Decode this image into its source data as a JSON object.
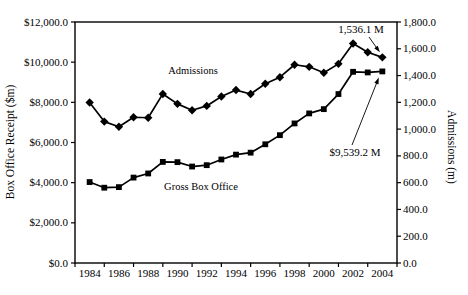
{
  "chart_data": {
    "type": "line",
    "title": "",
    "x": [
      1984,
      1985,
      1986,
      1987,
      1988,
      1989,
      1990,
      1991,
      1992,
      1993,
      1994,
      1995,
      1996,
      1997,
      1998,
      1999,
      2000,
      2001,
      2002,
      2003,
      2004
    ],
    "x_tick_labels": [
      "1984",
      "1986",
      "1988",
      "1990",
      "1992",
      "1994",
      "1996",
      "1998",
      "2000",
      "2002",
      "2004"
    ],
    "ylabel_left": "Box Office Receipt ($m)",
    "ylabel_right": "Admissions (m)",
    "ylim_left": [
      0,
      12000
    ],
    "ylim_right": [
      0,
      1800
    ],
    "y_left_tick_labels": [
      "$0.0",
      "$2,000.0",
      "$4,000.0",
      "$6,000.0",
      "$8,000.0",
      "$10,000.0",
      "$12,000.0"
    ],
    "y_right_tick_labels": [
      "0.0",
      "200.0",
      "400.0",
      "600.0",
      "800.0",
      "1,000.0",
      "1,200.0",
      "1,400.0",
      "1,600.0",
      "1,800.0"
    ],
    "grid": false,
    "legend_position": "none-inline-labels",
    "line_color": "#000000",
    "background_color": "#ffffff",
    "series": [
      {
        "name": "Admissions",
        "axis": "right",
        "marker": "diamond",
        "color": "#000000",
        "values": [
          1199.1,
          1056.1,
          1017.2,
          1088.5,
          1084.8,
          1262.8,
          1188.6,
          1140.6,
          1173.2,
          1244.0,
          1291.7,
          1262.6,
          1338.6,
          1387.7,
          1480.7,
          1465.2,
          1420.8,
          1487.3,
          1639.3,
          1574.0,
          1536.1
        ]
      },
      {
        "name": "Gross Box Office",
        "axis": "left",
        "marker": "square",
        "color": "#000000",
        "values": [
          4030.6,
          3749.4,
          3778.0,
          4252.9,
          4458.4,
          5033.4,
          5021.8,
          4803.2,
          4871.0,
          5154.2,
          5396.2,
          5493.5,
          5911.5,
          6365.9,
          6949.0,
          7448.0,
          7660.7,
          8412.5,
          9519.6,
          9488.5,
          9539.2
        ]
      }
    ],
    "series_labels": {
      "admissions": "Admissions",
      "gross_box_office": "Gross Box Office"
    },
    "annotations": [
      {
        "text": "1,536.1 M",
        "target_series": "Admissions",
        "target_year": 2004,
        "target_value": 1536.1
      },
      {
        "text": "$9,539.2 M",
        "target_series": "Gross Box Office",
        "target_year": 2004,
        "target_value": 9539.2
      }
    ]
  }
}
